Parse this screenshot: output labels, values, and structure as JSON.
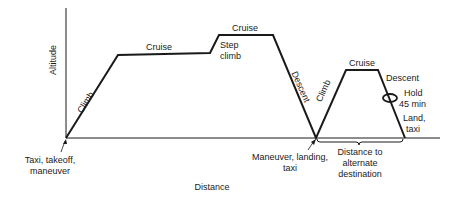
{
  "diagram": {
    "axes": {
      "y_label": "Altitude",
      "x_label": "Distance"
    },
    "segments": {
      "climb1": "Climb",
      "cruise1": "Cruise",
      "step_climb_line1": "Step",
      "step_climb_line2": "climb",
      "cruise2": "Cruise",
      "descent1": "Descent",
      "climb2": "Climb",
      "cruise3": "Cruise",
      "descent2": "Descent",
      "hold_line1": "Hold",
      "hold_line2": "45 min",
      "land_line1": "Land,",
      "land_line2": "taxi"
    },
    "annotations": {
      "takeoff_line1": "Taxi, takeoff,",
      "takeoff_line2": "maneuver",
      "landing_line1": "Maneuver, landing,",
      "landing_line2": "taxi",
      "alternate_line1": "Distance to",
      "alternate_line2": "alternate",
      "alternate_line3": "destination"
    }
  }
}
